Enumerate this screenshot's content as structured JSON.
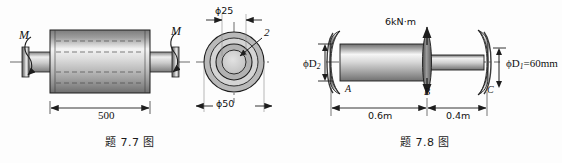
{
  "page": {
    "background": "#fdfdfd",
    "ink": "#1a1a1a"
  },
  "figures": [
    {
      "id": "fig-7-7",
      "caption": "题 7.7 图",
      "description": "shaft-with-cylindrical-hub",
      "labels": {
        "torque_left": "M",
        "torque_right": "M",
        "length": "500",
        "inner_diameter": "ϕ25",
        "outer_diameter": "ϕ50",
        "section_marker": "2"
      }
    },
    {
      "id": "fig-7-8",
      "caption": "题 7.8 图",
      "description": "stepped-shaft-with-flanges",
      "labels": {
        "torque": "6kN·m",
        "diameter_left": "ϕD",
        "diameter_left_sub": "2",
        "diameter_right": "ϕD",
        "diameter_right_sub": "1",
        "diameter_right_value": "=60mm",
        "point_a": "A",
        "point_b": "B",
        "point_c": "C",
        "span_ab": "0.6m",
        "span_bc": "0.4m"
      }
    }
  ],
  "colors": {
    "line": "#1d1d1d",
    "metal_dark": "#6e6e6e",
    "metal_mid": "#a8a8a8",
    "metal_light": "#f2f2f2",
    "ring_fill": "#b9b9b9",
    "ring_fill_light": "#d6d6d6",
    "center_fill": "#cfcfcf"
  }
}
